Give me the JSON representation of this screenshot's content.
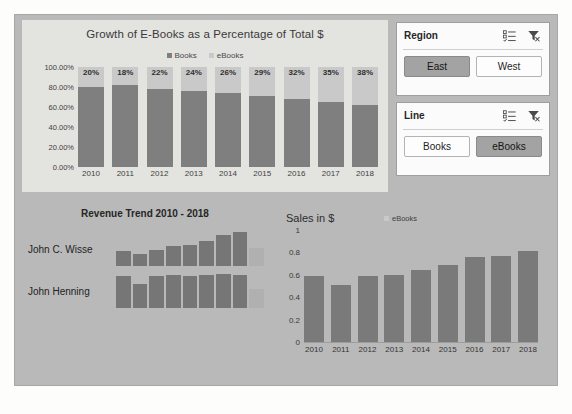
{
  "colors": {
    "canvas": "#fdfdfc",
    "dashboard_bg": "#b9b9b9",
    "chart_bg": "#e3e3e0",
    "series_books": "#7f7f7f",
    "series_ebooks": "#c9c9c9",
    "slicer_bg": "#fbfbfb",
    "slicer_selected": "#a3a3a3"
  },
  "stacked_chart": {
    "title": "Growth of E-Books as a Percentage of Total $",
    "legend": [
      {
        "label": "Books",
        "color": "#7f7f7f"
      },
      {
        "label": "eBooks",
        "color": "#c9c9c9"
      }
    ],
    "y_ticks": [
      "100.00%",
      "80.00%",
      "60.00%",
      "40.00%",
      "20.00%",
      "0.00%"
    ]
  },
  "slicers": [
    {
      "title": "Region",
      "multi_select_icon": "multi-select-icon",
      "clear_filter_icon": "clear-filter-icon",
      "items": [
        {
          "label": "East",
          "selected": true
        },
        {
          "label": "West",
          "selected": false
        }
      ]
    },
    {
      "title": "Line",
      "multi_select_icon": "multi-select-icon",
      "clear_filter_icon": "clear-filter-icon",
      "items": [
        {
          "label": "Books",
          "selected": false
        },
        {
          "label": "eBooks",
          "selected": true
        }
      ]
    }
  ],
  "sparkline_panel": {
    "title": "Revenue Trend 2010 - 2018",
    "rows": [
      {
        "name": "John C. Wisse"
      },
      {
        "name": "John Henning"
      }
    ]
  },
  "sales_chart": {
    "title": "Sales in $",
    "legend_label": "eBooks"
  },
  "chart_data": [
    {
      "id": "stacked",
      "type": "bar",
      "stacked": true,
      "percent": true,
      "title": "Growth of E-Books as a Percentage of Total $",
      "xlabel": "",
      "ylabel": "",
      "ylim": [
        0,
        1
      ],
      "y_tick_values": [
        1,
        0.8,
        0.6,
        0.4,
        0.2,
        0
      ],
      "y_tick_labels": [
        "100.00%",
        "80.00%",
        "60.00%",
        "40.00%",
        "20.00%",
        "0.00%"
      ],
      "grid": false,
      "legend_position": "top",
      "categories": [
        "2010",
        "2011",
        "2012",
        "2013",
        "2014",
        "2015",
        "2016",
        "2017",
        "2018"
      ],
      "series": [
        {
          "name": "Books",
          "color": "#7f7f7f",
          "values": [
            0.8,
            0.82,
            0.78,
            0.76,
            0.74,
            0.71,
            0.68,
            0.65,
            0.62
          ]
        },
        {
          "name": "eBooks",
          "color": "#c9c9c9",
          "values": [
            0.2,
            0.18,
            0.22,
            0.24,
            0.26,
            0.29,
            0.32,
            0.35,
            0.38
          ]
        }
      ],
      "data_labels": [
        "20%",
        "18%",
        "22%",
        "24%",
        "26%",
        "29%",
        "32%",
        "35%",
        "38%"
      ]
    },
    {
      "id": "sparkline-wisse",
      "type": "bar",
      "title": "John C. Wisse",
      "categories": [
        "2010",
        "2011",
        "2012",
        "2013",
        "2014",
        "2015",
        "2016",
        "2017",
        "2018"
      ],
      "values": [
        0.42,
        0.33,
        0.45,
        0.55,
        0.6,
        0.7,
        0.86,
        0.95,
        0.5
      ],
      "highlight_last": true,
      "grid": false,
      "xlabel": "",
      "ylabel": ""
    },
    {
      "id": "sparkline-henning",
      "type": "bar",
      "title": "John Henning",
      "categories": [
        "2010",
        "2011",
        "2012",
        "2013",
        "2014",
        "2015",
        "2016",
        "2017",
        "2018"
      ],
      "values": [
        0.88,
        0.68,
        0.88,
        0.92,
        0.88,
        0.9,
        0.94,
        0.92,
        0.52
      ],
      "highlight_last": true,
      "grid": false,
      "xlabel": "",
      "ylabel": ""
    },
    {
      "id": "sales",
      "type": "bar",
      "title": "Sales in $",
      "xlabel": "",
      "ylabel": "",
      "ylim": [
        0,
        1
      ],
      "y_tick_values": [
        1,
        0.8,
        0.6,
        0.4,
        0.2,
        0
      ],
      "y_tick_labels": [
        "1",
        "0.8",
        "0.6",
        "0.4",
        "0.2",
        "0"
      ],
      "grid": false,
      "legend_position": "top",
      "categories": [
        "2010",
        "2011",
        "2012",
        "2013",
        "2014",
        "2015",
        "2016",
        "2017",
        "2018"
      ],
      "series": [
        {
          "name": "eBooks",
          "color": "#7a7a7a",
          "values": [
            0.59,
            0.51,
            0.59,
            0.6,
            0.645,
            0.69,
            0.755,
            0.77,
            0.815
          ]
        }
      ]
    }
  ]
}
